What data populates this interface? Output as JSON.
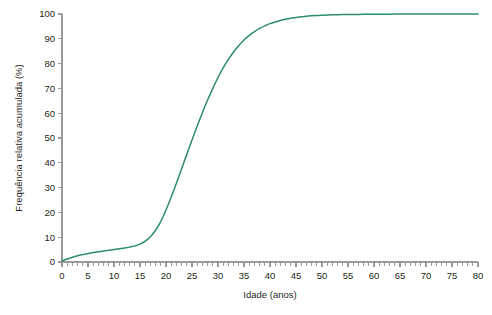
{
  "chart_data": {
    "type": "line",
    "title": "",
    "xlabel": "Idade (anos)",
    "ylabel": "Frequência relativa acumulada (%)",
    "xlim": [
      0,
      80
    ],
    "ylim": [
      0,
      100
    ],
    "grid": false,
    "legend": null,
    "series_color": "#2E8B72",
    "x_major_ticks": [
      0,
      5,
      10,
      15,
      20,
      25,
      30,
      35,
      40,
      45,
      50,
      55,
      60,
      65,
      70,
      75,
      80
    ],
    "x_minor_tick_step": 1,
    "y_major_ticks": [
      0,
      10,
      20,
      30,
      40,
      50,
      60,
      70,
      80,
      90,
      100
    ],
    "x_tick_labels": [
      "0",
      "5",
      "10",
      "15",
      "20",
      "25",
      "30",
      "35",
      "40",
      "45",
      "50",
      "55",
      "60",
      "65",
      "70",
      "75",
      "80"
    ],
    "y_tick_labels": [
      "0",
      "10",
      "20",
      "30",
      "40",
      "50",
      "60",
      "70",
      "80",
      "90",
      "100"
    ],
    "series": [
      {
        "name": "Frequência relativa acumulada",
        "x": [
          0,
          1,
          2,
          3,
          4,
          5,
          6,
          7,
          8,
          9,
          10,
          11,
          12,
          13,
          14,
          15,
          16,
          17,
          18,
          19,
          20,
          21,
          22,
          23,
          24,
          25,
          26,
          27,
          28,
          29,
          30,
          31,
          32,
          33,
          34,
          35,
          36,
          37,
          38,
          39,
          40,
          41,
          42,
          43,
          44,
          45,
          46,
          47,
          48,
          49,
          50,
          52,
          54,
          56,
          58,
          60,
          62,
          64,
          66,
          68,
          70,
          72,
          74,
          76,
          78,
          80
        ],
        "values": [
          0.4,
          1.2,
          1.9,
          2.5,
          3.0,
          3.4,
          3.8,
          4.1,
          4.4,
          4.7,
          5.0,
          5.3,
          5.6,
          6.0,
          6.5,
          7.2,
          8.4,
          10.2,
          12.8,
          16.4,
          21.0,
          26.2,
          31.8,
          37.6,
          43.4,
          49.2,
          54.8,
          60.2,
          65.3,
          70.0,
          74.4,
          78.3,
          81.7,
          84.7,
          87.3,
          89.5,
          91.4,
          92.9,
          94.2,
          95.2,
          96.1,
          96.8,
          97.4,
          97.9,
          98.3,
          98.6,
          98.9,
          99.1,
          99.3,
          99.4,
          99.5,
          99.65,
          99.75,
          99.82,
          99.87,
          99.9,
          99.93,
          99.95,
          99.96,
          99.97,
          99.98,
          99.985,
          99.99,
          99.995,
          100,
          100
        ]
      }
    ]
  },
  "layout": {
    "plot_left": 62,
    "plot_right": 478,
    "plot_top": 14,
    "plot_bottom": 262
  }
}
